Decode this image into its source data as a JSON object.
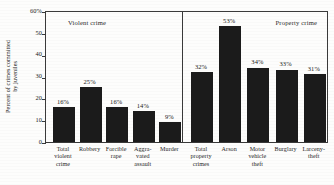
{
  "chart_data": {
    "type": "bar",
    "title": "",
    "xlabel": "",
    "ylabel_line1": "Percent of crimes committed",
    "ylabel_line2": "by juveniles",
    "ylim": [
      0,
      60
    ],
    "grid": false,
    "legend_position": "none",
    "ytick_labels": [
      "60%",
      "50",
      "40",
      "30",
      "20",
      "10",
      "0"
    ],
    "ytick_values": [
      60,
      50,
      40,
      30,
      20,
      10,
      0
    ],
    "panels": [
      {
        "name": "violent-crime",
        "title": "Violent crime",
        "categories": [
          {
            "lines": [
              "Total",
              "violent",
              "crime"
            ],
            "label": "Total violent crime"
          },
          {
            "lines": [
              "Robbery"
            ],
            "label": "Robbery"
          },
          {
            "lines": [
              "Forcible",
              "rape"
            ],
            "label": "Forcible rape"
          },
          {
            "lines": [
              "Aggra-",
              "vated",
              "assault"
            ],
            "label": "Aggravated assault"
          },
          {
            "lines": [
              "Murder"
            ],
            "label": "Murder"
          }
        ],
        "values": [
          16,
          25,
          16,
          14,
          9
        ],
        "value_labels": [
          "16%",
          "25%",
          "16%",
          "14%",
          "9%"
        ]
      },
      {
        "name": "property-crime",
        "title": "Property crime",
        "categories": [
          {
            "lines": [
              "Total",
              "property",
              "crimes"
            ],
            "label": "Total property crimes"
          },
          {
            "lines": [
              "Arson"
            ],
            "label": "Arson"
          },
          {
            "lines": [
              "Motor",
              "vehicle",
              "theft"
            ],
            "label": "Motor vehicle theft"
          },
          {
            "lines": [
              "Burglary"
            ],
            "label": "Burglary"
          },
          {
            "lines": [
              "Larceny-",
              "theft"
            ],
            "label": "Larceny-theft"
          }
        ],
        "values": [
          32,
          53,
          34,
          33,
          31
        ],
        "value_labels": [
          "32%",
          "53%",
          "34%",
          "33%",
          "31%"
        ]
      }
    ],
    "colors": {
      "bar": "#1b1b1b",
      "axis": "#3a3a3a",
      "background": "#fdfdfc",
      "text": "#1a1a1a"
    }
  }
}
